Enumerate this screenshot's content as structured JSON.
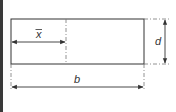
{
  "diagram": {
    "labels": {
      "centroid": "x",
      "depth": "d",
      "breadth": "b"
    },
    "colors": {
      "line": "#333333",
      "dashed": "#777777",
      "background": "#ffffff",
      "left_bar": "#3a3a3a"
    },
    "rectangle": {
      "x": 11,
      "y": 19,
      "width": 133,
      "height": 45
    },
    "centroid_line_x": 66,
    "dimensions": [
      {
        "name": "x-bar",
        "label": "x",
        "from": 11,
        "to": 66,
        "axis": "horizontal",
        "at": 42
      },
      {
        "name": "d",
        "label": "d",
        "from": 19,
        "to": 64,
        "axis": "vertical",
        "at": 165
      },
      {
        "name": "b",
        "label": "b",
        "from": 11,
        "to": 144,
        "axis": "horizontal",
        "at": 87
      }
    ]
  }
}
